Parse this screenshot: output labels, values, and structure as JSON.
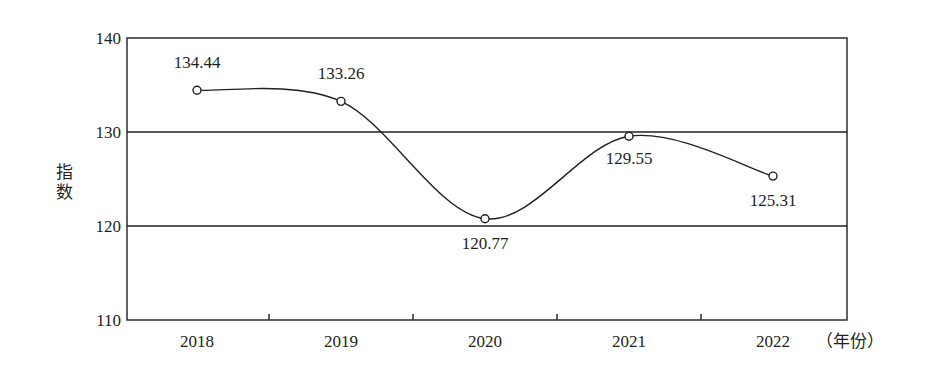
{
  "chart_data": {
    "type": "line",
    "title": "",
    "xlabel": "（年份）",
    "ylabel": "指数",
    "categories": [
      "2018",
      "2019",
      "2020",
      "2021",
      "2022"
    ],
    "series": [
      {
        "name": "指数",
        "values": [
          134.44,
          133.26,
          120.77,
          129.55,
          125.31
        ]
      }
    ],
    "data_labels": [
      "134.44",
      "133.26",
      "120.77",
      "129.55",
      "125.31"
    ],
    "ylim": [
      110,
      140
    ],
    "yticks": [
      110,
      120,
      130,
      140
    ],
    "grid": {
      "horizontal": [
        120,
        130
      ],
      "vertical": false
    },
    "smooth": true,
    "marker": "open-circle",
    "legend": null
  },
  "colors": {
    "line": "#231f20",
    "axis": "#231f20",
    "background": "#ffffff"
  }
}
